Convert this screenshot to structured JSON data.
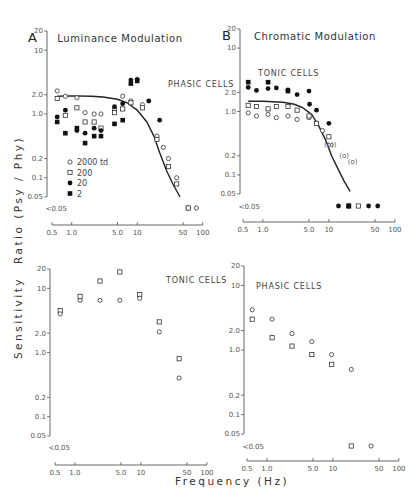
{
  "figure": {
    "ylabel_top": "Ratio (Psy / Phy)",
    "ylabel_bottom": "Sensitivity",
    "xlabel": "Frequency (Hz)",
    "x_ticks": [
      "0.5",
      "1.0",
      "5.0",
      "10",
      "50",
      "100"
    ],
    "x_tick_values": [
      0.5,
      1,
      5,
      10,
      50,
      100
    ],
    "y_ticks": [
      "20",
      "10",
      "2.0",
      "1.0",
      "0.2",
      "0.1",
      "0.05"
    ],
    "y_tick_values": [
      20,
      10,
      2,
      1,
      0.2,
      0.1,
      0.05
    ],
    "below_label": "<0.05"
  },
  "chart_data": [
    {
      "id": "A-top",
      "type": "scatter",
      "panel_letter": "A",
      "title": "Luminance Modulation",
      "cells_label": "PHASIC CELLS",
      "xlabel": "Frequency (Hz)",
      "ylabel": "Ratio (Psy / Phy)",
      "xscale": "log",
      "yscale": "log",
      "xlim": [
        0.5,
        100
      ],
      "ylim": [
        0.05,
        20
      ],
      "legend": [
        {
          "marker": "open-circle",
          "label": "2000 td"
        },
        {
          "marker": "open-square",
          "label": "200"
        },
        {
          "marker": "filled-circle",
          "label": "20"
        },
        {
          "marker": "filled-square",
          "label": "2"
        }
      ],
      "series": [
        {
          "name": "2000 td",
          "marker": "open-circle",
          "points": [
            [
              0.6,
              2.3
            ],
            [
              0.8,
              1.9
            ],
            [
              1.2,
              1.8
            ],
            [
              1.6,
              1.05
            ],
            [
              2.2,
              1.0
            ],
            [
              2.8,
              1.0
            ],
            [
              4.5,
              1.2
            ],
            [
              6,
              1.9
            ],
            [
              8,
              1.6
            ],
            [
              12,
              1.4
            ],
            [
              20,
              0.45
            ],
            [
              25,
              0.3
            ],
            [
              30,
              0.2
            ],
            [
              40,
              0.1
            ],
            [
              60,
              "<0.05"
            ],
            [
              80,
              "<0.05"
            ]
          ]
        },
        {
          "name": "200",
          "marker": "open-square",
          "points": [
            [
              0.6,
              1.75
            ],
            [
              0.8,
              0.95
            ],
            [
              1.2,
              1.25
            ],
            [
              1.6,
              0.75
            ],
            [
              2.2,
              0.75
            ],
            [
              2.8,
              0.6
            ],
            [
              4.5,
              1.05
            ],
            [
              6,
              1.2
            ],
            [
              8,
              1.5
            ],
            [
              12,
              1.25
            ],
            [
              20,
              0.4
            ],
            [
              30,
              0.15
            ],
            [
              40,
              0.08
            ],
            [
              60,
              "<0.05"
            ]
          ]
        },
        {
          "name": "20",
          "marker": "filled-circle",
          "points": [
            [
              0.6,
              0.9
            ],
            [
              0.8,
              1.15
            ],
            [
              1.2,
              0.55
            ],
            [
              1.6,
              0.5
            ],
            [
              2.2,
              0.6
            ],
            [
              2.8,
              0.55
            ],
            [
              4.5,
              1.3
            ],
            [
              6,
              1.45
            ],
            [
              8,
              3.4
            ],
            [
              10,
              3.5
            ],
            [
              15,
              1.6
            ],
            [
              22,
              0.8
            ]
          ]
        },
        {
          "name": "2",
          "marker": "filled-square",
          "points": [
            [
              0.6,
              0.75
            ],
            [
              0.8,
              0.5
            ],
            [
              1.2,
              0.6
            ],
            [
              1.6,
              0.35
            ],
            [
              2.2,
              0.45
            ],
            [
              2.8,
              0.45
            ],
            [
              4.5,
              0.7
            ],
            [
              6,
              0.8
            ],
            [
              8,
              3.0
            ],
            [
              10,
              3.3
            ]
          ]
        }
      ],
      "curve": [
        [
          0.6,
          1.9
        ],
        [
          1,
          1.92
        ],
        [
          2,
          1.9
        ],
        [
          3,
          1.85
        ],
        [
          5,
          1.7
        ],
        [
          7,
          1.5
        ],
        [
          10,
          1.15
        ],
        [
          14,
          0.75
        ],
        [
          18,
          0.45
        ],
        [
          22,
          0.25
        ],
        [
          28,
          0.13
        ],
        [
          35,
          0.08
        ],
        [
          45,
          0.05
        ]
      ]
    },
    {
      "id": "B-top",
      "type": "scatter",
      "panel_letter": "B",
      "title": "Chromatic Modulation",
      "cells_label": "TONIC CELLS",
      "xlabel": "Frequency (Hz)",
      "ylabel": "Ratio (Psy / Phy)",
      "xscale": "log",
      "yscale": "log",
      "xlim": [
        0.5,
        100
      ],
      "ylim": [
        0.05,
        20
      ],
      "series": [
        {
          "name": "2000 td",
          "marker": "open-circle",
          "points": [
            [
              0.6,
              0.95
            ],
            [
              0.8,
              0.85
            ],
            [
              1.2,
              0.9
            ],
            [
              1.6,
              0.8
            ],
            [
              2.4,
              0.85
            ],
            [
              3.3,
              0.75
            ],
            [
              5,
              0.8
            ],
            [
              6.5,
              0.65
            ],
            [
              8,
              0.5
            ],
            [
              10,
              "(0.3)"
            ],
            [
              11,
              "(0.3)"
            ],
            [
              17,
              "(0.2)"
            ],
            [
              23,
              "(0.16)"
            ]
          ]
        },
        {
          "name": "200",
          "marker": "open-square",
          "points": [
            [
              0.6,
              1.25
            ],
            [
              0.8,
              1.2
            ],
            [
              1.2,
              1.1
            ],
            [
              1.6,
              1.2
            ],
            [
              2.4,
              1.2
            ],
            [
              3.3,
              1.05
            ],
            [
              5,
              0.85
            ],
            [
              6.5,
              0.65
            ],
            [
              10,
              0.4
            ],
            [
              20,
              "<0.05"
            ],
            [
              28,
              "<0.05"
            ]
          ]
        },
        {
          "name": "20",
          "marker": "filled-circle",
          "points": [
            [
              0.6,
              2.4
            ],
            [
              0.8,
              2.15
            ],
            [
              1.2,
              2.3
            ],
            [
              1.6,
              2.35
            ],
            [
              2.4,
              2.2
            ],
            [
              3.3,
              1.85
            ],
            [
              5,
              2.1
            ],
            [
              5.1,
              1.3
            ],
            [
              6.5,
              1.05
            ],
            [
              10,
              0.65
            ],
            [
              14,
              "<0.05"
            ],
            [
              20,
              "<0.05"
            ],
            [
              40,
              "<0.05"
            ],
            [
              55,
              "<0.05"
            ]
          ]
        },
        {
          "name": "2",
          "marker": "filled-square",
          "points": [
            [
              0.6,
              2.9
            ],
            [
              1.2,
              2.9
            ],
            [
              2.4,
              2.1
            ],
            [
              20,
              "<0.05"
            ]
          ]
        }
      ],
      "curve": [
        [
          0.6,
          1.45
        ],
        [
          1,
          1.45
        ],
        [
          2,
          1.4
        ],
        [
          3,
          1.3
        ],
        [
          4,
          1.15
        ],
        [
          5.5,
          0.9
        ],
        [
          7,
          0.6
        ],
        [
          9,
          0.35
        ],
        [
          11,
          0.2
        ],
        [
          14,
          0.12
        ],
        [
          17,
          0.08
        ],
        [
          21,
          0.055
        ]
      ]
    },
    {
      "id": "A-bottom",
      "type": "scatter",
      "cells_label": "TONIC CELLS",
      "xlabel": "Frequency (Hz)",
      "ylabel": "Sensitivity",
      "xscale": "log",
      "yscale": "log",
      "xlim": [
        0.5,
        100
      ],
      "ylim": [
        0.05,
        20
      ],
      "series": [
        {
          "name": "square",
          "marker": "open-square",
          "points": [
            [
              0.6,
              4.5
            ],
            [
              1.2,
              7.5
            ],
            [
              2.4,
              13
            ],
            [
              4.8,
              18
            ],
            [
              9.6,
              8
            ],
            [
              19,
              3.0
            ],
            [
              38,
              0.8
            ]
          ]
        },
        {
          "name": "circle",
          "marker": "open-circle",
          "points": [
            [
              0.6,
              4.0
            ],
            [
              1.2,
              6.5
            ],
            [
              2.4,
              6.5
            ],
            [
              4.8,
              6.5
            ],
            [
              9.6,
              7.0
            ],
            [
              19,
              2.1
            ],
            [
              38,
              0.4
            ]
          ]
        }
      ]
    },
    {
      "id": "B-bottom",
      "type": "scatter",
      "cells_label": "PHASIC CELLS",
      "xlabel": "Frequency (Hz)",
      "ylabel": "Sensitivity",
      "xscale": "log",
      "yscale": "log",
      "xlim": [
        0.5,
        100
      ],
      "ylim": [
        0.05,
        20
      ],
      "series": [
        {
          "name": "circle",
          "marker": "open-circle",
          "points": [
            [
              0.6,
              4.2
            ],
            [
              1.2,
              3.0
            ],
            [
              2.4,
              1.8
            ],
            [
              4.8,
              1.35
            ],
            [
              9.6,
              0.85
            ],
            [
              19,
              0.5
            ],
            [
              38,
              "<0.05"
            ]
          ]
        },
        {
          "name": "square",
          "marker": "open-square",
          "points": [
            [
              0.6,
              3.0
            ],
            [
              1.2,
              1.55
            ],
            [
              2.4,
              1.15
            ],
            [
              4.8,
              0.85
            ],
            [
              9.6,
              0.6
            ],
            [
              19,
              "<0.05"
            ]
          ]
        }
      ]
    }
  ]
}
